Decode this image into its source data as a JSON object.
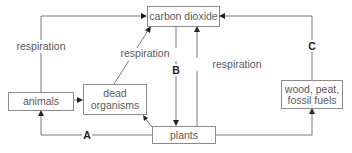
{
  "diagram": {
    "nodes": {
      "carbon_dioxide": "carbon dioxide",
      "animals": "animals",
      "dead_organisms": [
        "dead",
        "organisms"
      ],
      "plants": "plants",
      "fossil": [
        "wood, peat,",
        "fossil fuels"
      ]
    },
    "edges": {
      "animals_to_co2": "respiration",
      "dead_to_co2": "respiration",
      "plants_to_co2": "respiration",
      "co2_to_plants": "B",
      "plants_to_animals": "A",
      "fossil_to_co2": "C"
    },
    "colors": {
      "line": "#7a7a7a",
      "text": "#5a5a5a",
      "letter": "#222222"
    }
  }
}
